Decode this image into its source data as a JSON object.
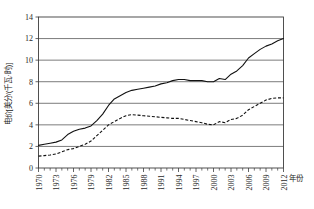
{
  "chart_data": {
    "type": "line",
    "title": "",
    "xlabel": "年份",
    "ylabel": "电价[美分/(千瓦·时)]",
    "xlim": [
      1970,
      2012
    ],
    "ylim": [
      0,
      14
    ],
    "ytick_values": [
      0,
      2,
      4,
      6,
      8,
      10,
      12,
      14
    ],
    "ytick_labels": [
      "0",
      "2",
      "4",
      "6",
      "8",
      "10",
      "12",
      "14"
    ],
    "xtick_values": [
      1970,
      1973,
      1976,
      1979,
      1982,
      1985,
      1988,
      1991,
      1994,
      1997,
      2000,
      2003,
      2006,
      2009,
      2012
    ],
    "xtick_labels": [
      "1970",
      "1973",
      "1976",
      "1979",
      "1982",
      "1985",
      "1988",
      "1991",
      "1994",
      "1997",
      "2000",
      "2003",
      "2006",
      "2009",
      "2012"
    ],
    "minor_xtick_step": 1,
    "grid": "horizontal",
    "legend": "none",
    "x": [
      1970,
      1971,
      1972,
      1973,
      1974,
      1975,
      1976,
      1977,
      1978,
      1979,
      1980,
      1981,
      1982,
      1983,
      1984,
      1985,
      1986,
      1987,
      1988,
      1989,
      1990,
      1991,
      1992,
      1993,
      1994,
      1995,
      1996,
      1997,
      1998,
      1999,
      2000,
      2001,
      2002,
      2003,
      2004,
      2005,
      2006,
      2007,
      2008,
      2009,
      2010,
      2011,
      2012
    ],
    "series": [
      {
        "name": "名义电价",
        "style": "solid",
        "values": [
          2.1,
          2.2,
          2.3,
          2.4,
          2.6,
          3.1,
          3.4,
          3.6,
          3.7,
          3.9,
          4.4,
          5.0,
          5.8,
          6.4,
          6.7,
          7.0,
          7.2,
          7.3,
          7.4,
          7.5,
          7.6,
          7.8,
          7.9,
          8.1,
          8.2,
          8.2,
          8.1,
          8.1,
          8.1,
          8.0,
          8.0,
          8.3,
          8.2,
          8.7,
          9.0,
          9.5,
          10.2,
          10.6,
          11.0,
          11.3,
          11.5,
          11.8,
          12.0
        ]
      },
      {
        "name": "实际电价",
        "style": "dashed",
        "values": [
          1.1,
          1.15,
          1.2,
          1.3,
          1.5,
          1.7,
          1.8,
          2.0,
          2.2,
          2.5,
          3.0,
          3.5,
          4.0,
          4.3,
          4.6,
          4.85,
          4.95,
          4.9,
          4.85,
          4.8,
          4.75,
          4.7,
          4.65,
          4.6,
          4.6,
          4.5,
          4.4,
          4.3,
          4.2,
          4.05,
          4.0,
          4.3,
          4.2,
          4.5,
          4.6,
          4.9,
          5.4,
          5.7,
          6.0,
          6.3,
          6.45,
          6.5,
          6.5
        ]
      }
    ]
  }
}
